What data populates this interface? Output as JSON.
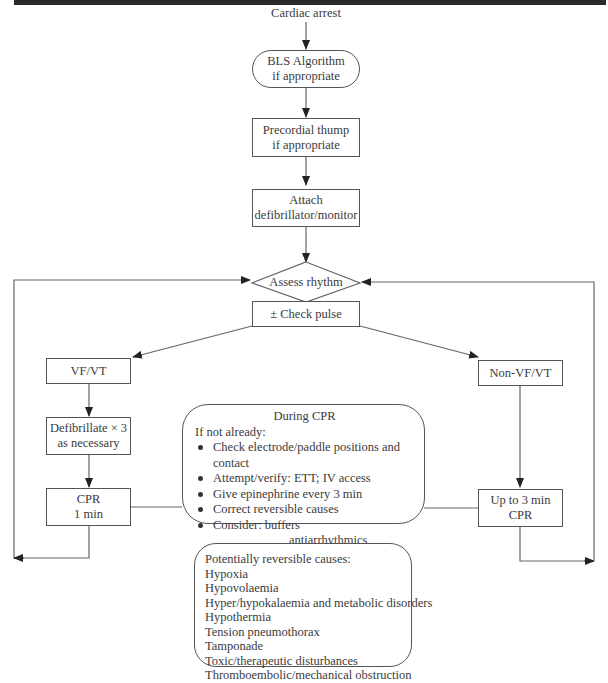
{
  "diagram": {
    "title": "Cardiac arrest",
    "nodes": {
      "bls": {
        "line1": "BLS Algorithm",
        "line2": "if appropriate"
      },
      "thump": {
        "line1": "Precordial thump",
        "line2": "if appropriate"
      },
      "attach": {
        "line1": "Attach",
        "line2": "defibrillator/monitor"
      },
      "assess": {
        "label": "Assess rhythm"
      },
      "pulse": {
        "label": "± Check pulse"
      },
      "vfvt": {
        "label": "VF/VT"
      },
      "nonvfvt": {
        "label": "Non-VF/VT"
      },
      "defib": {
        "line1": "Defibrillate × 3",
        "line2": "as necessary"
      },
      "cpr1": {
        "line1": "CPR",
        "line2": "1 min"
      },
      "cpr3": {
        "line1": "Up to 3 min",
        "line2": "CPR"
      }
    },
    "during_cpr": {
      "title": "During CPR",
      "intro": "If not already:",
      "items": [
        "Check electrode/paddle positions and contact",
        "Attempt/verify: ETT; IV access",
        "Give epinephrine every 3 min",
        "Correct reversible causes",
        "Consider: buffers"
      ],
      "consider_sub": [
        "antiarrhythmics",
        "atropine/pacing"
      ]
    },
    "reversible_causes": {
      "title": "Potentially reversible causes:",
      "items": [
        "Hypoxia",
        "Hypovolaemia",
        "Hyper/hypokalaemia and metabolic disorders",
        "Hypothermia",
        "Tension pneumothorax",
        "Tamponade",
        "Toxic/therapeutic disturbances",
        "Thromboembolic/mechanical obstruction"
      ]
    },
    "edges": [
      {
        "from": "Cardiac arrest",
        "to": "BLS Algorithm"
      },
      {
        "from": "BLS Algorithm",
        "to": "Precordial thump"
      },
      {
        "from": "Precordial thump",
        "to": "Attach defibrillator/monitor"
      },
      {
        "from": "Attach defibrillator/monitor",
        "to": "Assess rhythm"
      },
      {
        "from": "Check pulse",
        "to": "VF/VT"
      },
      {
        "from": "Check pulse",
        "to": "Non-VF/VT"
      },
      {
        "from": "VF/VT",
        "to": "Defibrillate × 3"
      },
      {
        "from": "Defibrillate × 3",
        "to": "CPR 1 min"
      },
      {
        "from": "CPR 1 min",
        "to": "Assess rhythm",
        "via": "left loop"
      },
      {
        "from": "Non-VF/VT",
        "to": "Up to 3 min CPR"
      },
      {
        "from": "Up to 3 min CPR",
        "to": "Assess rhythm",
        "via": "right loop"
      }
    ]
  }
}
